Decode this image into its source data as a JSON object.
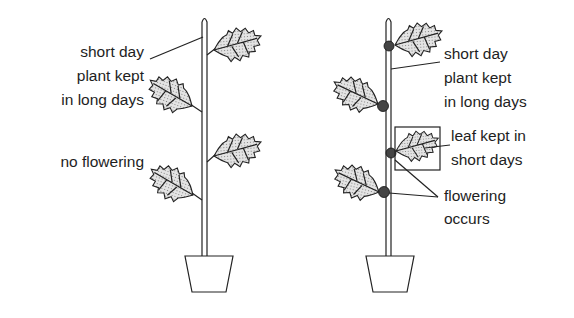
{
  "diagram": {
    "type": "biology-illustration",
    "left_plant": {
      "labels": {
        "condition_line1": "short day",
        "condition_line2": "plant kept",
        "condition_line3": "in long days",
        "result": "no flowering"
      }
    },
    "right_plant": {
      "labels": {
        "condition_line1": "short day",
        "condition_line2": "plant kept",
        "condition_line3": "in long days",
        "leaf_line1": "leaf kept in",
        "leaf_line2": "short days",
        "result_line1": "flowering",
        "result_line2": "occurs"
      }
    },
    "colors": {
      "ink": "#222222",
      "background": "#ffffff",
      "stipple": "#888888"
    }
  }
}
